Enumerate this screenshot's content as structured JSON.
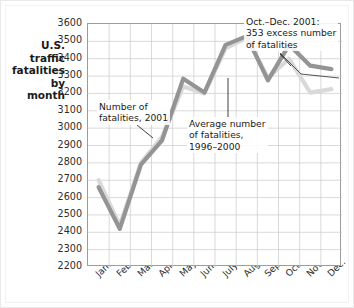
{
  "chart_data": {
    "type": "line",
    "title": "",
    "ylabel": "U.S.\ntraffic\nfatalities\nby\nmonth",
    "xlabel": "",
    "categories": [
      "Jan.",
      "Feb.",
      "March",
      "April",
      "May",
      "June",
      "July",
      "Aug.",
      "Sept.",
      "Oct.",
      "Nov.",
      "Dec."
    ],
    "ylim": [
      2200,
      3600
    ],
    "ytick_step": 100,
    "yticks": [
      3600,
      3500,
      3400,
      3300,
      3200,
      3100,
      3000,
      2900,
      2800,
      2700,
      2600,
      2500,
      2400,
      2300,
      2200
    ],
    "grid": true,
    "legend": "none",
    "series": [
      {
        "name": "Number of fatalities, 2001",
        "color": "#949494",
        "values": [
          2660,
          2420,
          2790,
          2930,
          3285,
          3205,
          3480,
          3530,
          3275,
          3480,
          3360,
          3340
        ]
      },
      {
        "name": "Average number of fatalities, 1996-2000",
        "color": "#d9d9d9",
        "values": [
          2700,
          2440,
          2800,
          2950,
          3240,
          3200,
          3460,
          3520,
          3290,
          3400,
          3205,
          3225
        ]
      }
    ],
    "annotations": [
      {
        "id": "fatalities-2001",
        "text": "Number of\nfatalities, 2001"
      },
      {
        "id": "average-fatalities",
        "text": "Average number\nof fatalities,\n1996–2000"
      },
      {
        "id": "excess-fatalities",
        "text": "Oct.–Dec. 2001:\n353 excess number\nof fatalities"
      }
    ]
  }
}
